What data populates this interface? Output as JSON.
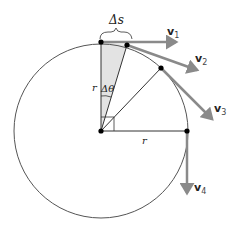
{
  "diagram": {
    "type": "uniform-circular-motion",
    "labels": {
      "arc_length": "Δs",
      "angle": "Δθ",
      "radius_vertical": "r",
      "radius_horizontal": "r"
    },
    "vectors": [
      {
        "name": "v",
        "sub": "1"
      },
      {
        "name": "v",
        "sub": "2"
      },
      {
        "name": "v",
        "sub": "3"
      },
      {
        "name": "v",
        "sub": "4"
      }
    ],
    "colors": {
      "circle": "#555555",
      "vector": "#8a8a8a",
      "wedge_fill": "#e3e3e3",
      "point": "#000000"
    }
  }
}
